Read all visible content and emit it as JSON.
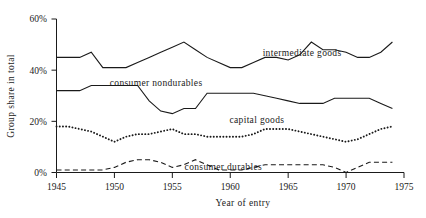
{
  "chart_data": {
    "type": "line",
    "title": "",
    "xlabel": "Year of entry",
    "ylabel": "Group share in total",
    "xlim": [
      1945,
      1975
    ],
    "ylim": [
      0,
      60
    ],
    "xticks": [
      "1945",
      "1950",
      "1955",
      "1960",
      "1965",
      "1970",
      "1975"
    ],
    "xtick_values": [
      1945,
      1950,
      1955,
      1960,
      1965,
      1970,
      1975
    ],
    "yticks": [
      "0%",
      "20%",
      "40%",
      "60%"
    ],
    "ytick_values": [
      0,
      20,
      40,
      60
    ],
    "grid": false,
    "legend": "inline-annotations",
    "x": [
      1945,
      1946,
      1947,
      1948,
      1949,
      1950,
      1951,
      1952,
      1953,
      1954,
      1955,
      1956,
      1957,
      1958,
      1959,
      1960,
      1961,
      1962,
      1963,
      1964,
      1965,
      1966,
      1967,
      1968,
      1969,
      1970,
      1971,
      1972,
      1973,
      1974
    ],
    "series": [
      {
        "name": "intermediate goods",
        "style": "solid",
        "label_x": 1966.2,
        "label_y": 47.0,
        "values": [
          45,
          45,
          45,
          47,
          41,
          41,
          41,
          43,
          45,
          47,
          49,
          51,
          48,
          45,
          43,
          41,
          41,
          43,
          45,
          45,
          44,
          46,
          51,
          48,
          48,
          47,
          45,
          45,
          47,
          51
        ]
      },
      {
        "name": "consumer nondurables",
        "style": "solid",
        "label_x": 1953.6,
        "label_y": 35.0,
        "values": [
          32,
          32,
          32,
          34,
          34,
          34,
          34,
          34,
          28,
          24,
          23,
          25,
          25,
          31,
          31,
          31,
          31,
          31,
          30,
          29,
          28,
          27,
          27,
          27,
          29,
          29,
          29,
          29,
          27,
          25
        ]
      },
      {
        "name": "capital goods",
        "style": "dotted",
        "label_x": 1962.3,
        "label_y": 20.5,
        "values": [
          18,
          18,
          17,
          16,
          14,
          12,
          14,
          15,
          15,
          16,
          17,
          15,
          15,
          14,
          14,
          14,
          14,
          15,
          17,
          17,
          17,
          16,
          15,
          14,
          13,
          12,
          13,
          15,
          17,
          18
        ]
      },
      {
        "name": "consumer durables",
        "style": "dashed",
        "label_x": 1959.4,
        "label_y": 2.4,
        "values": [
          1,
          1,
          1,
          1,
          1,
          2,
          4,
          5,
          5,
          4,
          2,
          3,
          5,
          3,
          1,
          1,
          1,
          2,
          3,
          3,
          3,
          3,
          3,
          3,
          2,
          0,
          2,
          4,
          4,
          4
        ]
      }
    ]
  },
  "axes": {
    "y_title": "Group share in total",
    "x_title": "Year of entry"
  }
}
